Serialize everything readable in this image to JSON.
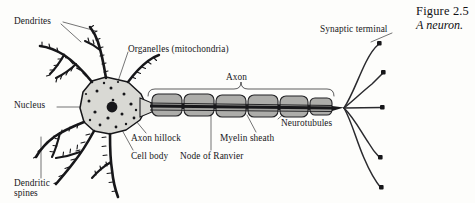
{
  "figure": {
    "caption_title": "Figure 2.5",
    "caption_subtitle": "A neuron.",
    "background_color": "#fdfdfb",
    "ink_color": "#17171a",
    "soma_fill": "#d9d9d4",
    "myelin_fill": "#a9a9a6"
  },
  "labels": {
    "dendrites": "Dendrites",
    "organelles": "Organelles (mitochondria)",
    "nucleus": "Nucleus",
    "dendritic_spines_line1": "Dendritic",
    "dendritic_spines_line2": "spines",
    "axon_hillock": "Axon hillock",
    "cell_body": "Cell body",
    "node_of_ranvier": "Node of Ranvier",
    "axon": "Axon",
    "myelin_sheath": "Myelin sheath",
    "neurotubules": "Neurotubules",
    "synaptic_terminal": "Synaptic terminal"
  },
  "diagram": {
    "type": "labeled-biological-illustration",
    "subject": "neuron",
    "parts": [
      "Dendrites",
      "Dendritic spines",
      "Cell body",
      "Nucleus",
      "Organelles (mitochondria)",
      "Axon hillock",
      "Axon",
      "Myelin sheath",
      "Node of Ranvier",
      "Neurotubules",
      "Synaptic terminal"
    ],
    "myelin_segment_count": 6,
    "dendrite_branch_count": 7,
    "terminal_bouton_count": 5
  }
}
